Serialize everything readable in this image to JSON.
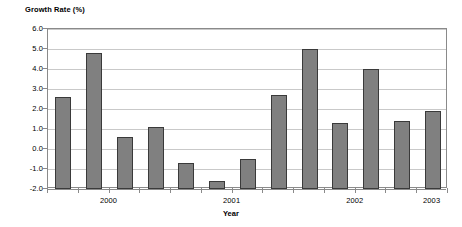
{
  "chart_data": {
    "type": "bar",
    "title": "",
    "ylabel": "Growth Rate (%)",
    "xlabel": "Year",
    "ylim": [
      -2.0,
      6.0
    ],
    "ytick_step": 1.0,
    "grid": true,
    "legend": "none",
    "bar_color": "#808080",
    "bar_border_color": "#3a3a3a",
    "gridline_color": "#c9c9c9",
    "axis_color": "#8a8a8a",
    "background": "#ffffff",
    "ytick_labels": [
      "6.0",
      "5.0",
      "4.0",
      "3.0",
      "2.0",
      "1.0",
      "0.0",
      "-1.0",
      "-2.0"
    ],
    "ytick_values": [
      6.0,
      5.0,
      4.0,
      3.0,
      2.0,
      1.0,
      0.0,
      -1.0,
      -2.0
    ],
    "group_labels": [
      "2000",
      "2001",
      "2002",
      "2003"
    ],
    "categories": [
      "2000 Q1",
      "2000 Q2",
      "2000 Q3",
      "2000 Q4",
      "2001 Q1",
      "2001 Q2",
      "2001 Q3",
      "2001 Q4",
      "2002 Q1",
      "2002 Q2",
      "2002 Q3",
      "2002 Q4",
      "2003 Q1"
    ],
    "values": [
      2.6,
      4.8,
      0.6,
      1.1,
      -0.7,
      -1.6,
      -0.5,
      2.7,
      5.0,
      1.3,
      4.0,
      1.4,
      1.9
    ]
  }
}
